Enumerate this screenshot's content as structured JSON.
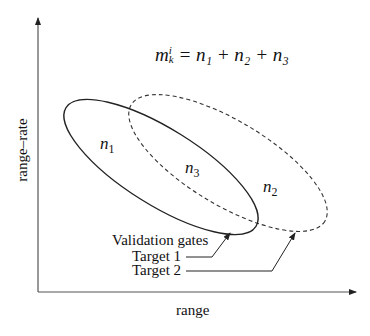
{
  "diagram": {
    "equation": {
      "lhs_base": "m",
      "lhs_sup": "i",
      "lhs_sub": "k",
      "rhs": " = n₁ + n₂ + n₃",
      "full_text": "m_k^i = n_1 + n_2 + n_3"
    },
    "axes": {
      "x_label": "range",
      "y_label": "range–rate"
    },
    "regions": [
      {
        "id": "n1",
        "base": "n",
        "sub": "1"
      },
      {
        "id": "n2",
        "base": "n",
        "sub": "2"
      },
      {
        "id": "n3",
        "base": "n",
        "sub": "3"
      }
    ],
    "legend": {
      "title": "Validation gates",
      "items": [
        {
          "label": "Target 1",
          "line_style": "solid"
        },
        {
          "label": "Target 2",
          "line_style": "dashed"
        }
      ]
    },
    "colors": {
      "stroke": "#222222",
      "axis": "#555555",
      "text": "#111111"
    }
  }
}
